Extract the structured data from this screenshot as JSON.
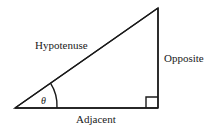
{
  "diagram": {
    "type": "right-triangle",
    "labels": {
      "hypotenuse": "Hypotenuse",
      "opposite": "Opposite",
      "adjacent": "Adjacent",
      "angle": "θ"
    },
    "colors": {
      "stroke": "#1a1a1a",
      "background": "#ffffff"
    },
    "right_angle_marker": true
  }
}
